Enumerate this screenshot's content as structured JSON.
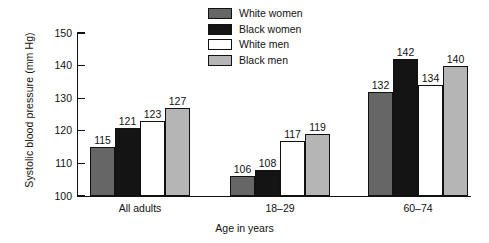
{
  "chart_data": {
    "type": "bar",
    "title": "",
    "xlabel": "Age in years",
    "ylabel": "Systolic blood pressure (mm Hg)",
    "ylim": [
      100,
      150
    ],
    "yticks": [
      100,
      110,
      120,
      130,
      140,
      150
    ],
    "grid": false,
    "legend_position": "top-center",
    "categories": [
      "All adults",
      "18–29",
      "60–74"
    ],
    "series": [
      {
        "name": "White women",
        "color": "#666666",
        "values": [
          115,
          106,
          132
        ]
      },
      {
        "name": "Black women",
        "color": "#141414",
        "values": [
          121,
          108,
          142
        ]
      },
      {
        "name": "White men",
        "color": "#ffffff",
        "values": [
          123,
          117,
          134
        ]
      },
      {
        "name": "Black men",
        "color": "#b5b5b5",
        "values": [
          127,
          119,
          140
        ]
      }
    ]
  }
}
